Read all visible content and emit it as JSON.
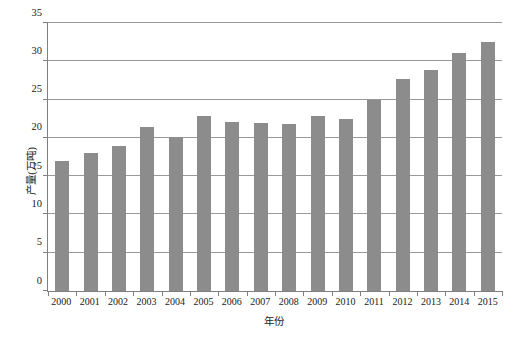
{
  "chart_data": {
    "type": "bar",
    "title": "",
    "subtitle": "",
    "xlabel": "年份",
    "ylabel": "产量(万吨)",
    "categories": [
      "2000",
      "2001",
      "2002",
      "2003",
      "2004",
      "2005",
      "2006",
      "2007",
      "2008",
      "2009",
      "2010",
      "2011",
      "2012",
      "2013",
      "2014",
      "2015"
    ],
    "values": [
      17.0,
      18.0,
      19.0,
      21.4,
      20.1,
      22.9,
      22.1,
      21.9,
      21.8,
      22.8,
      22.4,
      24.9,
      27.7,
      28.8,
      31.1,
      32.5
    ],
    "series": [
      {
        "name": "产量",
        "values": [
          17.0,
          18.0,
          19.0,
          21.4,
          20.1,
          22.9,
          22.1,
          21.9,
          21.8,
          22.8,
          22.4,
          24.9,
          27.7,
          28.8,
          31.1,
          32.5
        ]
      }
    ],
    "ylim": [
      0,
      35
    ],
    "yticks": [
      0,
      5,
      10,
      15,
      20,
      25,
      30,
      35
    ],
    "ytick_labels": [
      "0",
      "5",
      "10",
      "15",
      "20",
      "25",
      "30",
      "35"
    ],
    "grid": "horizontal",
    "legend": "none",
    "bar_color": "#8c8c8c",
    "gridline_color": "#9a9a9a",
    "axis_color": "#7f7f7f",
    "background_color": "#ffffff"
  }
}
